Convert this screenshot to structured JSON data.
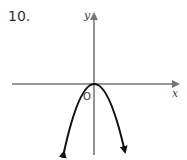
{
  "problem": {
    "number": "10."
  },
  "graph": {
    "x_label": "x",
    "y_label": "y",
    "origin_label": "O",
    "curve": "downward-opening parabola with vertex at origin",
    "colors": {
      "axis": "#777777",
      "curve": "#111111"
    }
  }
}
